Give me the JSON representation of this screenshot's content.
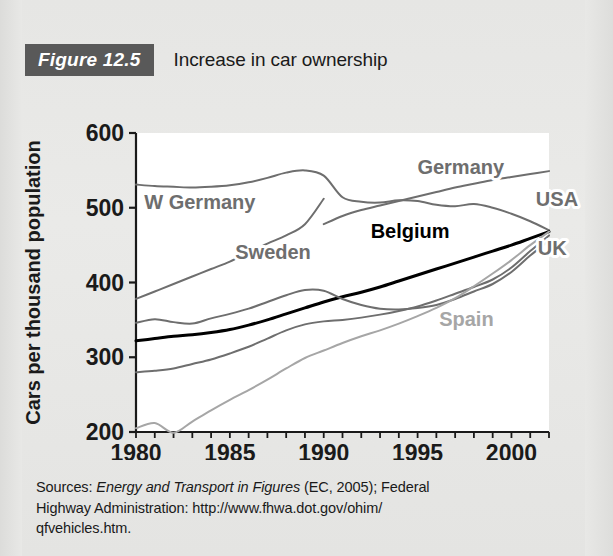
{
  "figure": {
    "badge": "Figure 12.5",
    "title": "Increase in car ownership"
  },
  "sources": {
    "line1_prefix": "Sources: ",
    "line1_italic": "Energy and Transport in Figures",
    "line1_suffix": " (EC, 2005); Federal",
    "line2": "Highway Administration: http://www.fhwa.dot.gov/ohim/",
    "line3": "qfvehicles.htm."
  },
  "colors": {
    "background": "#e8e8e6",
    "badge_bg": "#595959",
    "plot_bg": "#ffffff",
    "axis": "#1a1a1a",
    "series_gray": "#6e6e6e",
    "series_black": "#000000",
    "series_light": "#a6a6a6",
    "label_gray": "#6e6e6e"
  },
  "chart_data": {
    "type": "line",
    "title": "Increase in car ownership",
    "xlabel": "",
    "ylabel": "Cars per thousand population",
    "xlim": [
      1980,
      2002
    ],
    "ylim": [
      200,
      600
    ],
    "yticks": [
      200,
      300,
      400,
      500,
      600
    ],
    "ytick_labels": [
      "200",
      "300",
      "400",
      "500",
      "600"
    ],
    "xticks": [
      1980,
      1985,
      1990,
      1995,
      2000
    ],
    "xtick_labels": [
      "1980",
      "1985",
      "1990",
      "1995",
      "2000"
    ],
    "x_minor_tick_step": 1,
    "grid": false,
    "legend": "inline-labels",
    "series": [
      {
        "name": "W Germany",
        "color": "#6e6e6e",
        "width": 2,
        "label_x": 1983.4,
        "label_y": 498,
        "label_anchor": "middle",
        "x": [
          1980,
          1981,
          1982,
          1983,
          1984,
          1985,
          1986,
          1987,
          1988,
          1989,
          1990
        ],
        "values": [
          378,
          388,
          398,
          408,
          418,
          428,
          440,
          452,
          463,
          478,
          512
        ]
      },
      {
        "name": "Germany",
        "color": "#6e6e6e",
        "width": 2,
        "label_x": 1997.3,
        "label_y": 545,
        "label_anchor": "middle",
        "x": [
          1990,
          1991,
          1992,
          1993,
          1994,
          1995,
          1996,
          1997,
          1998,
          1999,
          2000,
          2001,
          2002
        ],
        "values": [
          478,
          489,
          497,
          503,
          509,
          515,
          521,
          527,
          532,
          537,
          541,
          545,
          549
        ]
      },
      {
        "name": "USA",
        "color": "#6e6e6e",
        "width": 2,
        "label_x": 2001.3,
        "label_y": 503,
        "label_anchor": "start",
        "x": [
          1980,
          1981,
          1982,
          1983,
          1984,
          1985,
          1986,
          1987,
          1988,
          1989,
          1990,
          1991,
          1992,
          1993,
          1994,
          1995,
          1996,
          1997,
          1998,
          1999,
          2000,
          2001,
          2002
        ],
        "values": [
          531,
          529,
          528,
          527,
          528,
          530,
          534,
          540,
          547,
          550,
          543,
          514,
          508,
          507,
          510,
          509,
          504,
          502,
          505,
          500,
          492,
          482,
          470
        ]
      },
      {
        "name": "Belgium",
        "color": "#000000",
        "width": 3,
        "label_x": 1994.6,
        "label_y": 459,
        "label_anchor": "middle",
        "bold": true,
        "x": [
          1980,
          1981,
          1982,
          1983,
          1984,
          1985,
          1986,
          1987,
          1988,
          1989,
          1990,
          1991,
          1992,
          1993,
          1994,
          1995,
          1996,
          1997,
          1998,
          1999,
          2000,
          2001,
          2002
        ],
        "values": [
          322,
          325,
          328,
          330,
          333,
          337,
          343,
          350,
          358,
          366,
          374,
          381,
          387,
          394,
          402,
          410,
          418,
          426,
          434,
          442,
          450,
          459,
          468
        ]
      },
      {
        "name": "Sweden",
        "color": "#6e6e6e",
        "width": 2,
        "label_x": 1987.3,
        "label_y": 431,
        "label_anchor": "middle",
        "x": [
          1980,
          1981,
          1982,
          1983,
          1984,
          1985,
          1986,
          1987,
          1988,
          1989,
          1990,
          1991,
          1992,
          1993,
          1994,
          1995,
          1996,
          1997,
          1998,
          1999,
          2000,
          2001,
          2002
        ],
        "values": [
          346,
          351,
          347,
          345,
          352,
          358,
          365,
          374,
          383,
          390,
          389,
          378,
          370,
          365,
          364,
          366,
          370,
          378,
          388,
          398,
          414,
          436,
          456
        ]
      },
      {
        "name": "UK",
        "color": "#6e6e6e",
        "width": 2,
        "label_x": 2001.4,
        "label_y": 437,
        "label_anchor": "start",
        "x": [
          1980,
          1981,
          1982,
          1983,
          1984,
          1985,
          1986,
          1987,
          1988,
          1989,
          1990,
          1991,
          1992,
          1993,
          1994,
          1995,
          1996,
          1997,
          1998,
          1999,
          2000,
          2001,
          2002
        ],
        "values": [
          280,
          282,
          285,
          291,
          297,
          305,
          314,
          325,
          336,
          344,
          348,
          350,
          353,
          357,
          362,
          368,
          376,
          385,
          394,
          404,
          420,
          442,
          463
        ]
      },
      {
        "name": "Spain",
        "color": "#a6a6a6",
        "width": 2,
        "label_x": 1997.6,
        "label_y": 342,
        "label_anchor": "middle",
        "x": [
          1980,
          1981,
          1982,
          1983,
          1984,
          1985,
          1986,
          1987,
          1988,
          1989,
          1990,
          1991,
          1992,
          1993,
          1994,
          1995,
          1996,
          1997,
          1998,
          1999,
          2000,
          2001,
          2002
        ],
        "values": [
          205,
          212,
          199,
          214,
          229,
          243,
          256,
          270,
          285,
          299,
          309,
          319,
          328,
          336,
          345,
          355,
          366,
          379,
          395,
          412,
          430,
          450,
          468
        ]
      }
    ]
  }
}
